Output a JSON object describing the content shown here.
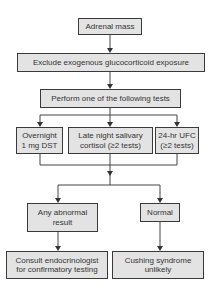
{
  "diagram": {
    "type": "flowchart",
    "nodes": {
      "start": "Adrenal mass",
      "exclude": "Exclude exogenous glucocorticoid exposure",
      "perform": "Perform one of the following tests",
      "test1": "Overnight 1 mg DST",
      "test1_l1": "Overnight",
      "test1_l2": "1 mg DST",
      "test2_l1": "Late night salivary",
      "test2_l2": "cortisol (≥2 tests)",
      "test3_l1": "24-hr UFC",
      "test3_l2": "(≥2 tests)",
      "abnormal_l1": "Any abnormal",
      "abnormal_l2": "result",
      "normal": "Normal",
      "consult_l1": "Consult endocrinologist",
      "consult_l2": "for confirmatory testing",
      "unlikely_l1": "Cushing syndrome",
      "unlikely_l2": "unlikely"
    },
    "colors": {
      "box_fill": "#e3e3e3",
      "border": "#3a3a3a",
      "text": "#333333"
    }
  }
}
